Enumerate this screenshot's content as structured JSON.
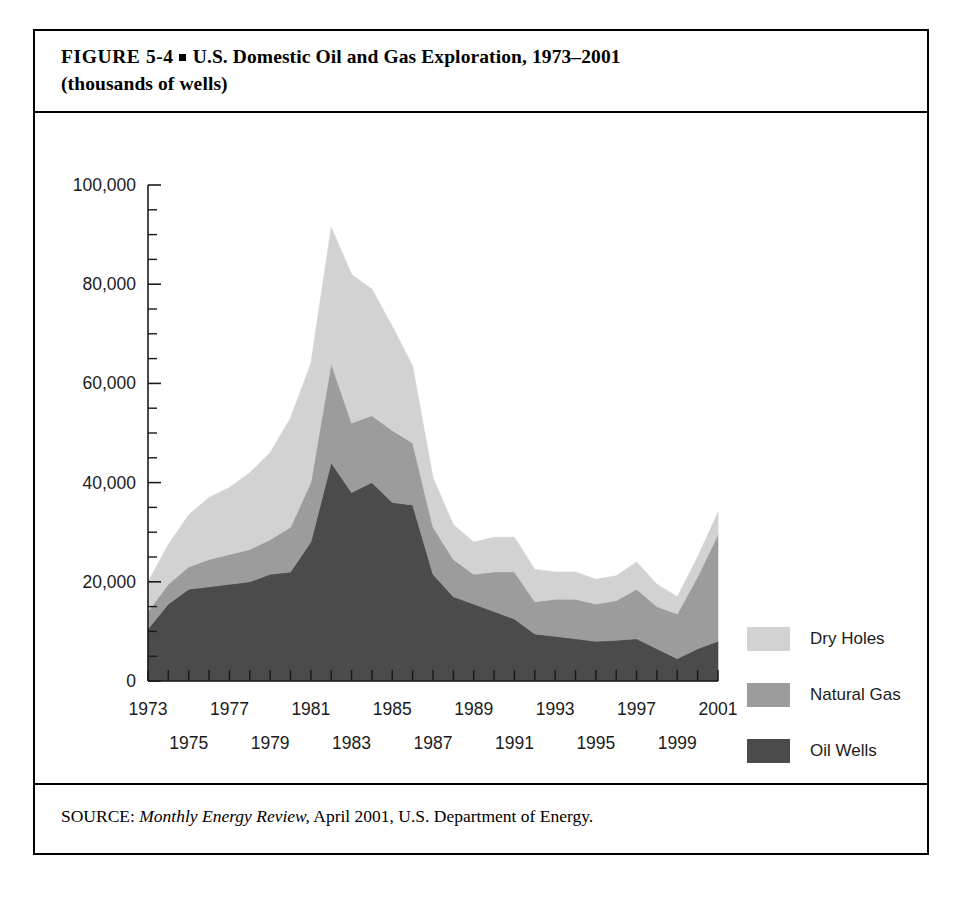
{
  "figure": {
    "label": "FIGURE 5-4",
    "bullet": "square-bullet",
    "title_line1": "U.S. Domestic Oil and Gas Exploration, 1973–2001",
    "title_line2": "(thousands of wells)",
    "source_prefix": "SOURCE:",
    "source_italic": "Monthly Energy Review,",
    "source_rest": "April 2001, U.S. Department of Energy."
  },
  "colors": {
    "dry_holes": "#d2d2d2",
    "natural_gas": "#9c9c9c",
    "oil_wells": "#4b4b4b",
    "axis": "#1b1b1b",
    "frame": "#000000",
    "background": "#ffffff"
  },
  "legend": {
    "position": "right",
    "items": [
      {
        "label": "Dry Holes",
        "color": "#d2d2d2",
        "swatch": "dry-holes-swatch"
      },
      {
        "label": "Natural Gas",
        "color": "#9c9c9c",
        "swatch": "natural-gas-swatch"
      },
      {
        "label": "Oil Wells",
        "color": "#4b4b4b",
        "swatch": "oil-wells-swatch"
      }
    ]
  },
  "chart_data": {
    "type": "area",
    "stacked": true,
    "title": "U.S. Domestic Oil and Gas Exploration, 1973–2001 (thousands of wells)",
    "xlabel": "",
    "ylabel": "",
    "grid": false,
    "legend_position": "right",
    "ylim": [
      0,
      100000
    ],
    "xlim": [
      1973,
      2001
    ],
    "ytick_labels": [
      "100,000",
      "80,000",
      "60,000",
      "40,000",
      "20,000",
      "0"
    ],
    "ytick_values": [
      100000,
      80000,
      60000,
      40000,
      20000,
      0
    ],
    "ytick_minor_step": 5000,
    "xtick_labels_top_row": [
      "1973",
      "1977",
      "1981",
      "1985",
      "1989",
      "1993",
      "1997",
      "2001"
    ],
    "xtick_labels_bottom_row": [
      "1975",
      "1979",
      "1983",
      "1987",
      "1991",
      "1995",
      "1999"
    ],
    "x": [
      1973,
      1974,
      1975,
      1976,
      1977,
      1978,
      1979,
      1980,
      1981,
      1982,
      1983,
      1984,
      1985,
      1986,
      1987,
      1988,
      1989,
      1990,
      1991,
      1992,
      1993,
      1994,
      1995,
      1996,
      1997,
      1998,
      1999,
      2000,
      2001
    ],
    "series": [
      {
        "name": "Oil Wells",
        "color": "#4b4b4b",
        "values": [
          10500,
          15500,
          18500,
          19000,
          19500,
          20000,
          21500,
          22000,
          28000,
          44000,
          38000,
          40000,
          36000,
          35500,
          21500,
          17000,
          15500,
          14000,
          12500,
          9500,
          9000,
          8500,
          8000,
          8200,
          8500,
          6500,
          4500,
          6500,
          8000
        ]
      },
      {
        "name": "Natural Gas",
        "color": "#9c9c9c",
        "values": [
          3500,
          4000,
          4500,
          5500,
          6000,
          6500,
          7000,
          9000,
          12000,
          20000,
          14000,
          13500,
          14500,
          12500,
          9500,
          7500,
          6000,
          8000,
          9500,
          6500,
          7500,
          8000,
          7500,
          8000,
          10000,
          8500,
          9000,
          14500,
          21500
        ]
      },
      {
        "name": "Dry Holes",
        "color": "#d2d2d2",
        "values": [
          6000,
          8000,
          10500,
          12500,
          13500,
          15500,
          17500,
          22000,
          24000,
          27500,
          30000,
          25500,
          21000,
          15500,
          10000,
          7000,
          6500,
          7000,
          7000,
          6500,
          5500,
          5500,
          5000,
          5000,
          5500,
          4500,
          3500,
          4000,
          4500
        ]
      }
    ],
    "totals": [
      20000,
      27500,
      33500,
      37000,
      39000,
      42000,
      46000,
      53000,
      64000,
      91500,
      82000,
      79000,
      71500,
      63500,
      41000,
      31500,
      28000,
      29000,
      29000,
      22500,
      22000,
      22000,
      20500,
      21200,
      24000,
      19500,
      17000,
      25000,
      34000
    ]
  }
}
